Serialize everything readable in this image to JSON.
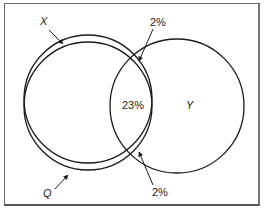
{
  "diagram": {
    "type": "venn",
    "sets": [
      {
        "name": "X",
        "label": "X"
      },
      {
        "name": "Q",
        "label": "Q"
      },
      {
        "name": "Y",
        "label": "Y"
      }
    ],
    "labels": {
      "x_label": "X",
      "q_label": "Q",
      "y_label": "Y",
      "top_pct": "2%",
      "center_pct": "23%",
      "bottom_pct": "2%"
    },
    "colors": {
      "stroke": "#1a1a1a",
      "background": "#ffffff",
      "frame": "#6a6a6a"
    }
  }
}
